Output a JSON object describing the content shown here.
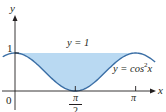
{
  "chart_data": {
    "type": "area",
    "title": "",
    "xlabel": "x",
    "ylabel": "y",
    "x_ticks": [
      {
        "value": 0,
        "label": "0"
      },
      {
        "value": 1.5708,
        "label": "π/2"
      },
      {
        "value": 3.1416,
        "label": "π"
      }
    ],
    "y_ticks": [
      {
        "value": 1,
        "label": "1"
      }
    ],
    "series": [
      {
        "name": "y = 1",
        "expression": "1",
        "kind": "line",
        "color": "#b07ab8"
      },
      {
        "name": "y = cos²x",
        "expression": "cos(x)^2",
        "kind": "curve",
        "color": "#3a6ea5",
        "x_range": [
          -0.32,
          3.65
        ]
      }
    ],
    "shaded_region": {
      "between": [
        "y = cos²x",
        "y = 1"
      ],
      "x_range": [
        0,
        3.1416
      ],
      "color": "#b9d9f2"
    },
    "xlim": [
      -0.38,
      3.95
    ],
    "ylim": [
      -0.55,
      2.4
    ],
    "annotations": [
      {
        "text": "y = 1",
        "position": "above line near center"
      },
      {
        "text": "y = cos²x",
        "position": "right, below curve"
      }
    ],
    "grid": false,
    "legend": "none"
  },
  "labels": {
    "y_axis": "y",
    "x_axis": "x",
    "origin": "0",
    "y_one": "1",
    "pi_half_num": "π",
    "pi_half_den": "2",
    "pi": "π",
    "line_label": "y = 1",
    "curve_label_prefix": "y = cos",
    "curve_label_sup": "2",
    "curve_label_suffix": "x"
  },
  "colors": {
    "axis": "#231f20",
    "curve": "#3a6ea5",
    "fill": "#b9d9f2",
    "line_left": "#a57ac0",
    "line_right": "#f0a060"
  }
}
